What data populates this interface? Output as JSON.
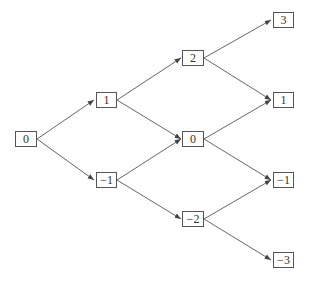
{
  "diagram": {
    "type": "binomial-tree",
    "colors": {
      "line": "#555555",
      "box_border": "#555555",
      "text": "#333333",
      "background": "#ffffff"
    },
    "nodes": [
      {
        "id": "n0_0",
        "label": "0",
        "level": 0,
        "cx": 26,
        "cy": 139
      },
      {
        "id": "n1_1",
        "label": "1",
        "level": 1,
        "cx": 106,
        "cy": 100
      },
      {
        "id": "n1_m1",
        "label": "−1",
        "level": 1,
        "cx": 106,
        "cy": 180
      },
      {
        "id": "n2_2",
        "label": "2",
        "level": 2,
        "cx": 193,
        "cy": 58
      },
      {
        "id": "n2_0",
        "label": "0",
        "level": 2,
        "cx": 193,
        "cy": 139
      },
      {
        "id": "n2_m2",
        "label": "−2",
        "level": 2,
        "cx": 193,
        "cy": 219
      },
      {
        "id": "n3_3",
        "label": "3",
        "level": 3,
        "cx": 283,
        "cy": 20
      },
      {
        "id": "n3_1",
        "label": "1",
        "level": 3,
        "cx": 283,
        "cy": 100
      },
      {
        "id": "n3_m1",
        "label": "−1",
        "level": 3,
        "cx": 283,
        "cy": 180
      },
      {
        "id": "n3_m3",
        "label": "−3",
        "level": 3,
        "cx": 283,
        "cy": 260
      }
    ],
    "edges": [
      [
        "n0_0",
        "n1_1"
      ],
      [
        "n0_0",
        "n1_m1"
      ],
      [
        "n1_1",
        "n2_2"
      ],
      [
        "n1_1",
        "n2_0"
      ],
      [
        "n1_m1",
        "n2_0"
      ],
      [
        "n1_m1",
        "n2_m2"
      ],
      [
        "n2_2",
        "n3_3"
      ],
      [
        "n2_2",
        "n3_1"
      ],
      [
        "n2_0",
        "n3_1"
      ],
      [
        "n2_0",
        "n3_m1"
      ],
      [
        "n2_m2",
        "n3_m1"
      ],
      [
        "n2_m2",
        "n3_m3"
      ]
    ]
  }
}
